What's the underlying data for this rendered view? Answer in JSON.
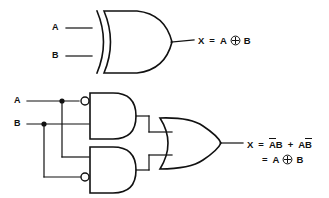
{
  "figure": {
    "background_color": "#ffffff",
    "line_color": "#111111"
  },
  "top_circuit": {
    "name": "xor-gate-circuit",
    "gate_type": "XOR",
    "inputs": [
      {
        "label": "A",
        "x": 57,
        "y": 28
      },
      {
        "label": "B",
        "x": 57,
        "y": 56
      }
    ],
    "output": {
      "label": "X",
      "equation_parts": {
        "output": "X",
        "equals": "=",
        "operand_left": "A",
        "operator_icon": "xor-circle-plus-icon",
        "operand_right": "B"
      }
    }
  },
  "bottom_circuit": {
    "name": "and-or-equivalent-circuit",
    "inputs": [
      {
        "label": "A",
        "x": 17,
        "y": 101
      },
      {
        "label": "B",
        "x": 17,
        "y": 124
      }
    ],
    "gates": [
      {
        "name": "and-gate-top",
        "type": "AND",
        "inverted_input": "top",
        "produces": "NOT-A AND B"
      },
      {
        "name": "and-gate-bottom",
        "type": "AND",
        "inverted_input": "bottom",
        "produces": "A AND NOT-B"
      },
      {
        "name": "or-gate",
        "type": "OR",
        "produces": "sum of products"
      }
    ],
    "output": {
      "label": "X",
      "line1": {
        "output": "X",
        "equals": "=",
        "term1_bar": "A",
        "term1_plain": "B",
        "plus": "+",
        "term2_plain": "A",
        "term2_bar": "B"
      },
      "line2": {
        "equals": "=",
        "operand_left": "A",
        "operator_icon": "xor-circle-plus-icon",
        "operand_right": "B"
      }
    }
  }
}
